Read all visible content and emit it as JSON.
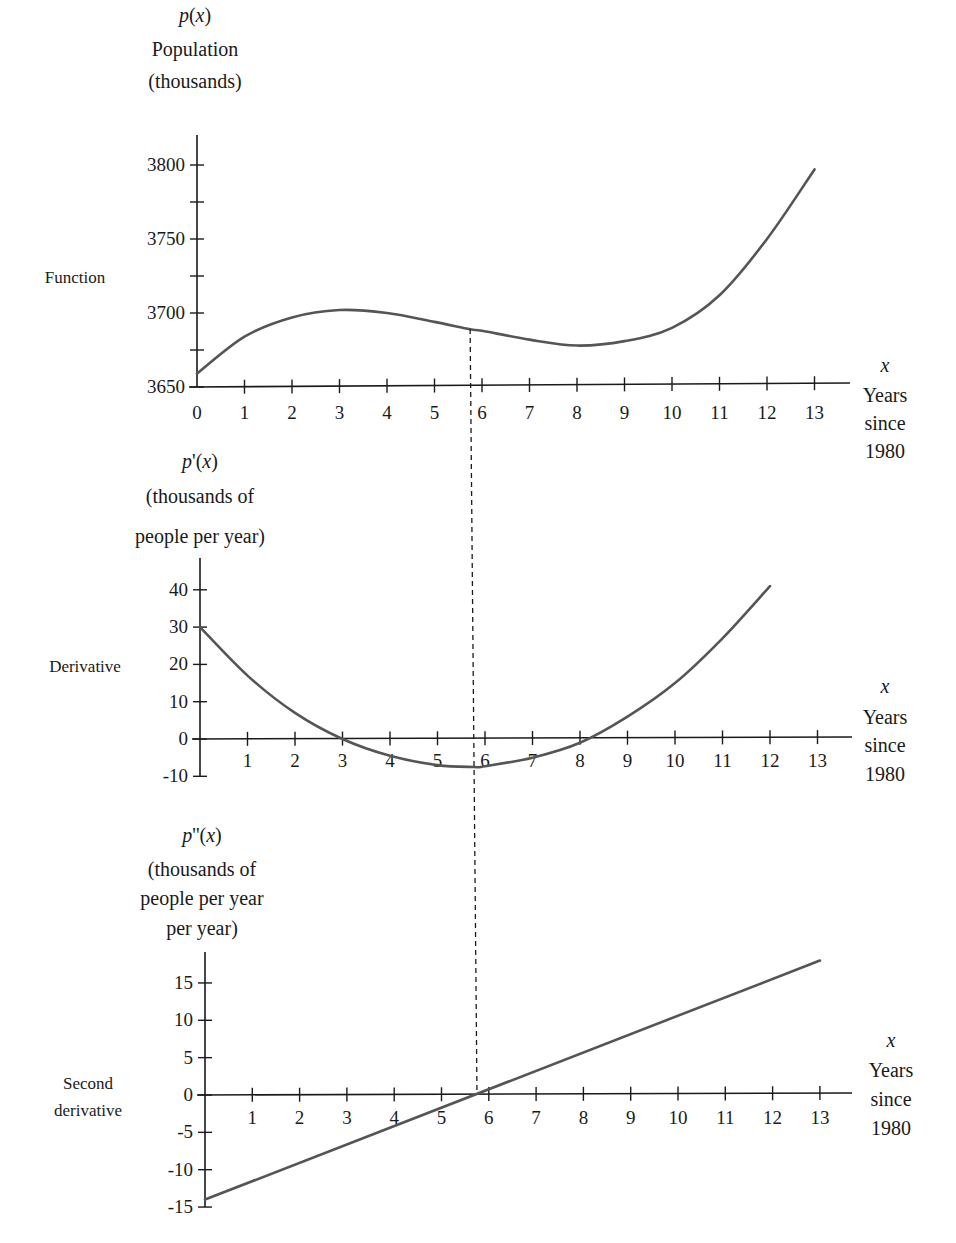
{
  "chart_data": [
    {
      "type": "line",
      "name": "Function",
      "side_label": "Function",
      "ylabel_lines": [
        "p(x)",
        "Population",
        "(thousands)"
      ],
      "xlabel_lines": [
        "x",
        "Years",
        "since",
        "1980"
      ],
      "x_ticks": [
        0,
        1,
        2,
        3,
        4,
        5,
        6,
        7,
        8,
        9,
        10,
        11,
        12,
        13
      ],
      "y_ticks": [
        3650,
        3700,
        3750,
        3800
      ],
      "y_minor_ticks": [
        3675,
        3725,
        3775
      ],
      "ylim": [
        3650,
        3820
      ],
      "xlim": [
        0,
        13.5
      ],
      "series": [
        {
          "name": "p(x)",
          "x": [
            0,
            1,
            2,
            3,
            4,
            5,
            5.75,
            6,
            7,
            8,
            9,
            10,
            11,
            12,
            13
          ],
          "values": [
            3659,
            3684,
            3697,
            3702,
            3700,
            3694,
            3689,
            3688,
            3682,
            3678,
            3681,
            3690,
            3712,
            3750,
            3797
          ]
        }
      ]
    },
    {
      "type": "line",
      "name": "Derivative",
      "side_label": "Derivative",
      "ylabel_lines": [
        "p'(x)",
        "(thousands of",
        "people per year)"
      ],
      "xlabel_lines": [
        "x",
        "Years",
        "since",
        "1980"
      ],
      "x_ticks": [
        1,
        2,
        3,
        4,
        5,
        6,
        7,
        8,
        9,
        10,
        11,
        12,
        13
      ],
      "y_ticks": [
        -10,
        0,
        10,
        20,
        30,
        40
      ],
      "ylim": [
        -10,
        48
      ],
      "xlim": [
        0,
        13.5
      ],
      "series": [
        {
          "name": "p'(x)",
          "x": [
            0,
            1,
            2,
            3,
            4,
            5,
            5.75,
            6,
            7,
            8,
            9,
            10,
            11,
            12
          ],
          "values": [
            30,
            17,
            7,
            0,
            -4.5,
            -7,
            -7.5,
            -7.3,
            -5,
            -1,
            6,
            15,
            27,
            41
          ]
        }
      ]
    },
    {
      "type": "line",
      "name": "Second derivative",
      "side_label_lines": [
        "Second",
        "derivative"
      ],
      "ylabel_lines": [
        "p''(x)",
        "(thousands of",
        "people per year",
        "per year)"
      ],
      "xlabel_lines": [
        "x",
        "Years",
        "since",
        "1980"
      ],
      "x_ticks": [
        1,
        2,
        3,
        4,
        5,
        6,
        7,
        8,
        9,
        10,
        11,
        12,
        13
      ],
      "y_ticks": [
        -15,
        -10,
        -5,
        0,
        5,
        10,
        15
      ],
      "ylim": [
        -15,
        19
      ],
      "xlim": [
        0,
        13.5
      ],
      "series": [
        {
          "name": "p''(x)",
          "x": [
            0,
            5.75,
            13
          ],
          "values": [
            -14,
            0,
            18
          ]
        }
      ]
    }
  ],
  "annotation": {
    "type": "dashed-vertical-line",
    "x": 5.75,
    "description": "inflection point connecting all three graphs"
  },
  "colors": {
    "curve": "#555555",
    "axis": "#1a1a1a",
    "text": "#1a1a1a"
  }
}
